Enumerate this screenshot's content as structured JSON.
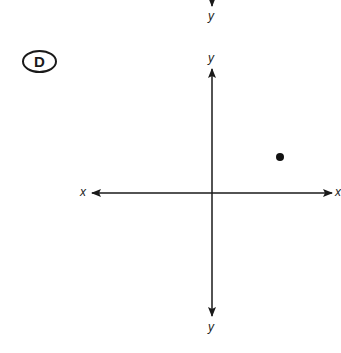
{
  "option": {
    "letter": "D"
  },
  "axes": {
    "top_prev_label": "y",
    "y_top_label": "y",
    "y_bottom_label": "y",
    "x_left_label": "x",
    "x_right_label": "x"
  },
  "point": {
    "quadrant": "I",
    "description": "single point plotted in the first quadrant"
  },
  "colors": {
    "ink": "#1a1a1a",
    "background": "#ffffff"
  }
}
